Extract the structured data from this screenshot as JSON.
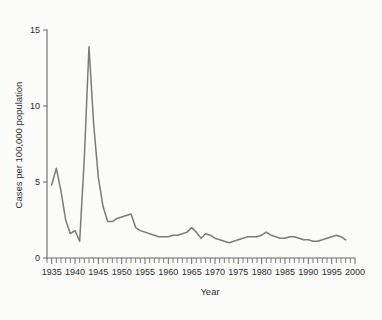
{
  "figure": {
    "background_color": "#fbfbfa",
    "line_color": "#7b7b7b",
    "axis_color": "#6a6a6a",
    "text_color": "#2c2c2c"
  },
  "chart_data": {
    "type": "line",
    "title": "",
    "xlabel": "Year",
    "ylabel": "Cases per 100,000 population",
    "xlim": [
      1934,
      2000
    ],
    "ylim": [
      0,
      15
    ],
    "grid": false,
    "legend": null,
    "x_ticks": [
      1935,
      1940,
      1945,
      1950,
      1955,
      1960,
      1965,
      1970,
      1975,
      1980,
      1985,
      1990,
      1995,
      2000
    ],
    "x_tick_labels": [
      "1935",
      "1940",
      "1945",
      "1950",
      "1955",
      "1960",
      "1965",
      "1970",
      "1975",
      "1980",
      "1985",
      "1990",
      "1995",
      "2000"
    ],
    "x_minor_tick_step": 1,
    "y_ticks": [
      0,
      5,
      10,
      15
    ],
    "y_tick_labels": [
      "0",
      "5",
      "10",
      "15"
    ],
    "series": [
      {
        "name": "Cases per 100,000 population",
        "color": "#7b7b7b",
        "x": [
          1935,
          1936,
          1937,
          1938,
          1939,
          1940,
          1941,
          1942,
          1943,
          1944,
          1945,
          1946,
          1947,
          1948,
          1949,
          1950,
          1951,
          1952,
          1953,
          1954,
          1955,
          1956,
          1957,
          1958,
          1959,
          1960,
          1961,
          1962,
          1963,
          1964,
          1965,
          1966,
          1967,
          1968,
          1969,
          1970,
          1971,
          1972,
          1973,
          1974,
          1975,
          1976,
          1977,
          1978,
          1979,
          1980,
          1981,
          1982,
          1983,
          1984,
          1985,
          1986,
          1987,
          1988,
          1989,
          1990,
          1991,
          1992,
          1993,
          1994,
          1995,
          1996,
          1997,
          1998
        ],
        "y": [
          4.8,
          5.9,
          4.4,
          2.5,
          1.6,
          1.8,
          1.1,
          6.6,
          13.9,
          8.8,
          5.3,
          3.4,
          2.4,
          2.4,
          2.6,
          2.7,
          2.8,
          2.9,
          2.0,
          1.8,
          1.7,
          1.6,
          1.5,
          1.4,
          1.4,
          1.4,
          1.5,
          1.5,
          1.6,
          1.7,
          2.0,
          1.7,
          1.3,
          1.6,
          1.5,
          1.3,
          1.2,
          1.1,
          1.0,
          1.1,
          1.2,
          1.3,
          1.4,
          1.4,
          1.4,
          1.5,
          1.7,
          1.5,
          1.4,
          1.3,
          1.3,
          1.4,
          1.4,
          1.3,
          1.2,
          1.2,
          1.1,
          1.1,
          1.2,
          1.3,
          1.4,
          1.5,
          1.4,
          1.2
        ]
      }
    ]
  }
}
